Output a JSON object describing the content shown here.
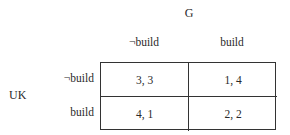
{
  "game": {
    "column_player": "G",
    "row_player": "UK",
    "column_strategies": [
      "¬build",
      "build"
    ],
    "row_strategies": [
      "¬build",
      "build"
    ],
    "payoffs": [
      [
        "3, 3",
        "1, 4"
      ],
      [
        "4, 1",
        "2, 2"
      ]
    ]
  }
}
